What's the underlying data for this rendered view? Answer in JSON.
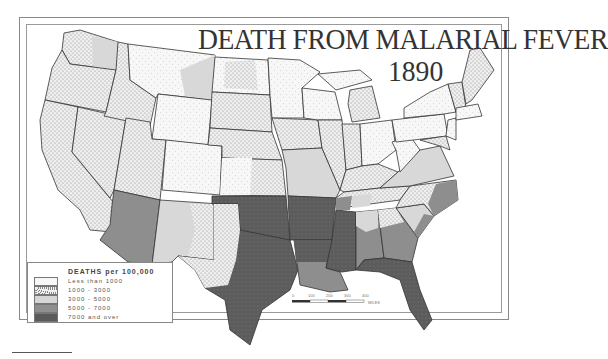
{
  "title": "DEATH FROM MALARIAL FEVER",
  "year": "1890",
  "legend": {
    "title": "DEATHS per 100,000",
    "items": [
      {
        "label": "Less than 1000",
        "color": "#f6f6f6",
        "pattern": "sparse-dots"
      },
      {
        "label": "1000 - 3000",
        "color": "#e4e4e4",
        "pattern": "dense-dots"
      },
      {
        "label": "3000 - 5000",
        "color": "#d6d6d6",
        "pattern": "flat"
      },
      {
        "label": "5000 - 7000",
        "color": "#8f8f8f",
        "pattern": "flat"
      },
      {
        "label": "7000 and over",
        "color": "#5a5a5a",
        "pattern": "dotted-dark"
      }
    ]
  },
  "scale": {
    "ticks": [
      "0",
      "100",
      "200",
      "300",
      "400"
    ],
    "unit": "MILES"
  },
  "regions": {
    "less_than_1000": [
      "Montana",
      "Wyoming",
      "Colorado",
      "Utah (north)",
      "North Dakota (east)",
      "Minnesota",
      "Wisconsin",
      "Michigan UP",
      "Ohio",
      "New York",
      "Pennsylvania",
      "New England",
      "West Virginia",
      "New Mexico (east, partial)"
    ],
    "1000_3000": [
      "Washington",
      "Oregon",
      "California",
      "Nevada",
      "Idaho",
      "Utah",
      "South Dakota",
      "Nebraska",
      "Kansas",
      "Iowa",
      "Illinois",
      "Indiana",
      "Michigan LP",
      "Kentucky",
      "Texas (west)",
      "Maine",
      "Vermont",
      "New Hampshire",
      "Massachusetts"
    ],
    "3000_5000": [
      "New Mexico",
      "Missouri",
      "Virginia",
      "Tennessee (part)",
      "South Carolina (part)",
      "Alabama (north)"
    ],
    "5000_7000": [
      "Arizona",
      "Louisiana",
      "Georgia",
      "Alabama (south)",
      "North Carolina (east)",
      "South Carolina (coast)"
    ],
    "7000_and_over": [
      "Oklahoma/Indian Territory",
      "Texas (east)",
      "Arkansas",
      "Mississippi",
      "Louisiana (north)",
      "Florida"
    ]
  }
}
